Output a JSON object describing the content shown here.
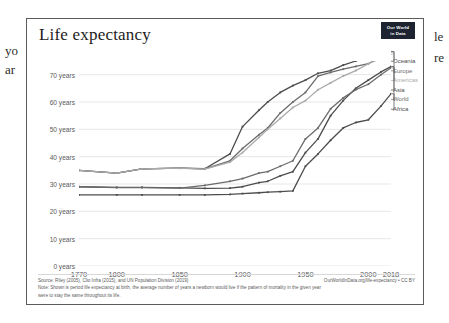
{
  "background_document": {
    "left_fragment_1": "yo",
    "left_fragment_2": "ar",
    "right_fragment_1": "le",
    "right_fragment_2": "re"
  },
  "chart_card": {
    "title": "Life expectancy",
    "logo": {
      "line1": "Our World",
      "line2": "in Data"
    },
    "footer": {
      "source": "Source: Riley (2005), Clio Infra (2015), and UN Population Division (2019)",
      "url": "OurWorldInData.org/life-expectancy • CC BY",
      "note_line1": "Note: Shown is period life expectancy at birth, the average number of years a newborn would live if the pattern of mortality in the given year",
      "note_line2": "were to stay the same throughout its life."
    }
  },
  "chart_data": {
    "type": "line",
    "title": "Life expectancy",
    "xlabel": "",
    "ylabel": "",
    "xlim": [
      1770,
      2018
    ],
    "ylim": [
      0,
      75
    ],
    "grid": true,
    "legend_position": "right",
    "xticks": [
      1770,
      1800,
      1850,
      1900,
      1950,
      2000,
      2018
    ],
    "xticklabels": [
      "1770",
      "1800",
      "1850",
      "1900",
      "1950",
      "2000",
      "2018"
    ],
    "yticks": [
      0,
      10,
      20,
      30,
      40,
      50,
      60,
      70
    ],
    "yticklabels": [
      "0 years",
      "10 years",
      "20 years",
      "30 years",
      "40 years",
      "50 years",
      "60 years",
      "70 years"
    ],
    "x": [
      1770,
      1800,
      1820,
      1850,
      1870,
      1890,
      1900,
      1913,
      1920,
      1930,
      1940,
      1950,
      1960,
      1970,
      1980,
      1990,
      2000,
      2010,
      2018
    ],
    "series": [
      {
        "name": "Oceania",
        "color": "#4c4c4c",
        "values": [
          35.0,
          34.0,
          35.5,
          35.8,
          35.6,
          41.0,
          51.0,
          57.0,
          60.0,
          63.5,
          66.0,
          68.0,
          70.5,
          71.5,
          73.5,
          75.0,
          76.5,
          77.5,
          78.5
        ]
      },
      {
        "name": "Europe",
        "color": "#6b6b6b",
        "values": [
          35.0,
          34.0,
          35.5,
          35.8,
          35.5,
          38.5,
          43.0,
          48.0,
          50.5,
          56.0,
          60.0,
          63.5,
          69.5,
          70.8,
          72.0,
          73.0,
          74.0,
          76.5,
          78.3
        ]
      },
      {
        "name": "Americas",
        "color": "#aaaaaa",
        "values": [
          35.0,
          34.0,
          35.5,
          35.8,
          35.4,
          38.0,
          41.5,
          47.0,
          50.0,
          54.0,
          58.0,
          60.5,
          64.5,
          67.0,
          69.5,
          71.5,
          74.0,
          76.0,
          77.5
        ]
      },
      {
        "name": "Asia",
        "color": "#4c4c4c",
        "values": [
          29.0,
          28.8,
          28.8,
          28.6,
          28.4,
          28.5,
          29.0,
          30.5,
          31.0,
          33.0,
          34.5,
          41.5,
          46.5,
          55.0,
          60.5,
          65.0,
          68.0,
          71.0,
          73.0
        ]
      },
      {
        "name": "World",
        "color": "#6b6b6b",
        "values": [
          29.0,
          28.7,
          28.7,
          28.5,
          29.5,
          31.0,
          32.0,
          34.0,
          34.5,
          36.5,
          38.5,
          46.5,
          50.5,
          57.5,
          61.5,
          64.5,
          66.5,
          70.0,
          72.5
        ]
      },
      {
        "name": "Africa",
        "color": "#4c4c4c",
        "values": [
          26.0,
          26.0,
          26.0,
          26.0,
          26.0,
          26.2,
          26.5,
          26.8,
          27.0,
          27.2,
          27.5,
          36.5,
          41.0,
          46.0,
          50.5,
          52.5,
          53.5,
          58.5,
          63.0
        ]
      }
    ],
    "legend_order": [
      "Oceania",
      "Europe",
      "Americas",
      "Asia",
      "World",
      "Africa"
    ],
    "legend_end_values": {
      "Oceania": 78.5,
      "Europe": 78.3,
      "Americas": 77.5,
      "Asia": 73.0,
      "World": 72.5,
      "Africa": 63.0
    }
  }
}
